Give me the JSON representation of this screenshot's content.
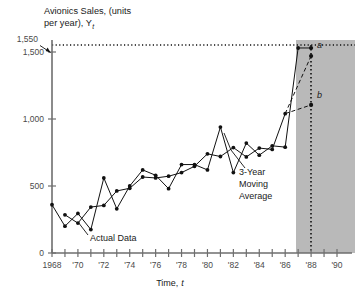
{
  "chart_data": {
    "type": "line",
    "title": "Avionics Sales, (units per year), Y",
    "title_line1": "Avionics Sales, (units",
    "title_line2": "per year), Y",
    "title_subscript": "t",
    "xlabel": "Time,",
    "xlabel_italic": "t",
    "ylabel": "",
    "xlim": [
      1968,
      1990
    ],
    "ylim": [
      0,
      1550
    ],
    "grid": false,
    "legend_position": "inline-annotations",
    "y_ticks": [
      0,
      500,
      1000,
      1500
    ],
    "y_tick_labels": [
      "0",
      "500",
      "1,000",
      "1,500"
    ],
    "y_special_tick": 1550,
    "y_special_label": "1,550",
    "x_ticks": [
      1968,
      1969,
      1970,
      1971,
      1972,
      1973,
      1974,
      1975,
      1976,
      1977,
      1978,
      1979,
      1980,
      1981,
      1982,
      1983,
      1984,
      1985,
      1986,
      1987,
      1988,
      1989,
      1990
    ],
    "x_tick_labels": [
      "1968",
      "",
      "'70",
      "",
      "'72",
      "",
      "'74",
      "",
      "'76",
      "",
      "'78",
      "",
      "'80",
      "",
      "'82",
      "",
      "'84",
      "",
      "'86",
      "",
      "'88",
      "",
      "'90"
    ],
    "series": [
      {
        "name": "Actual Data",
        "x": [
          1968,
          1969,
          1970,
          1971,
          1972,
          1973,
          1974,
          1975,
          1976,
          1977,
          1978,
          1979,
          1980,
          1981,
          1982,
          1983,
          1984,
          1985,
          1986,
          1987
        ],
        "values": [
          360,
          200,
          295,
          175,
          560,
          330,
          500,
          620,
          580,
          480,
          660,
          660,
          620,
          940,
          600,
          820,
          730,
          800,
          790,
          1530
        ]
      },
      {
        "name": "3-Year Moving Average",
        "x": [
          1969,
          1970,
          1971,
          1972,
          1973,
          1974,
          1975,
          1976,
          1977,
          1978,
          1979,
          1980,
          1981,
          1982,
          1983,
          1984,
          1985,
          1986
        ],
        "values": [
          285,
          223,
          343,
          355,
          463,
          483,
          567,
          560,
          573,
          600,
          647,
          740,
          720,
          787,
          717,
          783,
          773,
          1040
        ]
      }
    ],
    "annotations": [
      {
        "id": "actual-data-label",
        "text": "Actual Data",
        "x_px": 90,
        "y_px": 238
      },
      {
        "id": "moving-average-label",
        "text_lines": [
          "3-Year",
          "Moving",
          "Average"
        ],
        "x_px": 239,
        "y_px": 172
      },
      {
        "id": "forecast-point-a",
        "text": "a",
        "italic": true,
        "year": 1988,
        "value": 1530
      },
      {
        "id": "forecast-point-b",
        "text": "b",
        "italic": true,
        "year": 1988,
        "value": 1105
      }
    ],
    "forecast": {
      "shade_start_year": 1987.1,
      "shade_end_year": 1991.1,
      "vertical_line_year": 1988,
      "horizontal_reference_value": 1550,
      "dashed_paths": [
        {
          "from_year": 1986,
          "from_value": 1040,
          "to_year": 1988,
          "to_value": 1470,
          "label": "a-projection"
        },
        {
          "from_year": 1986,
          "from_value": 1040,
          "to_year": 1988,
          "to_value": 1105,
          "label": "b-projection"
        }
      ]
    },
    "colors": {
      "line": "#111111",
      "axis": "#6e6e6e",
      "shade": "#b9b9b9",
      "background": "#ffffff"
    }
  }
}
